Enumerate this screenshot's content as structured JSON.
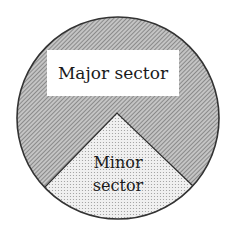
{
  "diagram": {
    "type": "circle-sectors",
    "circle": {
      "cx": 118,
      "cy": 118,
      "r": 101
    },
    "colors": {
      "outline": "#333333",
      "major_fill_base": "#bdbdbd",
      "major_hatch": "#6e6e6e",
      "minor_fill_base": "#efefef",
      "minor_dot": "#9a9a9a",
      "label_box": "#ffffff"
    },
    "labels": {
      "major": "Major sector",
      "minor_line1": "Minor",
      "minor_line2": "sector"
    }
  }
}
